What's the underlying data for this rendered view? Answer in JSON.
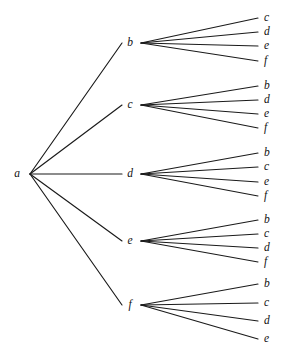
{
  "figure": {
    "type": "tree-diagram",
    "title": "",
    "background_color": "#ffffff",
    "line_color": "#1a1a1a",
    "text_color": "#111111",
    "width": 288,
    "height": 352
  },
  "tree": {
    "root": {
      "label": "a",
      "label_x": 17,
      "label_y": 174,
      "hub_x": 30,
      "hub_y": 174
    },
    "level1": [
      {
        "label": "b",
        "label_x": 130,
        "label_y": 43,
        "hub_x": 141,
        "hub_y": 43,
        "edge_end_x": 122,
        "children": [
          {
            "label": "c",
            "label_x": 264,
            "label_y": 18,
            "line_end_x": 258
          },
          {
            "label": "d",
            "label_x": 264,
            "label_y": 32,
            "line_end_x": 258
          },
          {
            "label": "e",
            "label_x": 264,
            "label_y": 46,
            "line_end_x": 258
          },
          {
            "label": "f",
            "label_x": 264,
            "label_y": 61,
            "line_end_x": 258
          }
        ]
      },
      {
        "label": "c",
        "label_x": 130,
        "label_y": 105,
        "hub_x": 141,
        "hub_y": 105,
        "edge_end_x": 122,
        "children": [
          {
            "label": "b",
            "label_x": 264,
            "label_y": 86,
            "line_end_x": 258
          },
          {
            "label": "d",
            "label_x": 264,
            "label_y": 100,
            "line_end_x": 258
          },
          {
            "label": "e",
            "label_x": 264,
            "label_y": 114,
            "line_end_x": 258
          },
          {
            "label": "f",
            "label_x": 264,
            "label_y": 128,
            "line_end_x": 258
          }
        ]
      },
      {
        "label": "d",
        "label_x": 130,
        "label_y": 174,
        "hub_x": 141,
        "hub_y": 174,
        "edge_end_x": 122,
        "children": [
          {
            "label": "b",
            "label_x": 264,
            "label_y": 153,
            "line_end_x": 258
          },
          {
            "label": "c",
            "label_x": 264,
            "label_y": 167,
            "line_end_x": 258
          },
          {
            "label": "e",
            "label_x": 264,
            "label_y": 182,
            "line_end_x": 258
          },
          {
            "label": "f",
            "label_x": 264,
            "label_y": 196,
            "line_end_x": 258
          }
        ]
      },
      {
        "label": "e",
        "label_x": 130,
        "label_y": 241,
        "hub_x": 141,
        "hub_y": 241,
        "edge_end_x": 122,
        "children": [
          {
            "label": "b",
            "label_x": 264,
            "label_y": 220,
            "line_end_x": 258
          },
          {
            "label": "c",
            "label_x": 264,
            "label_y": 234,
            "line_end_x": 258
          },
          {
            "label": "d",
            "label_x": 264,
            "label_y": 248,
            "line_end_x": 258
          },
          {
            "label": "f",
            "label_x": 264,
            "label_y": 262,
            "line_end_x": 258
          }
        ]
      },
      {
        "label": "f",
        "label_x": 130,
        "label_y": 305,
        "hub_x": 141,
        "hub_y": 305,
        "edge_end_x": 122,
        "children": [
          {
            "label": "b",
            "label_x": 264,
            "label_y": 284,
            "line_end_x": 258
          },
          {
            "label": "c",
            "label_x": 264,
            "label_y": 303,
            "line_end_x": 258
          },
          {
            "label": "d",
            "label_x": 264,
            "label_y": 321,
            "line_end_x": 258
          },
          {
            "label": "e",
            "label_x": 264,
            "label_y": 339,
            "line_end_x": 258
          }
        ]
      }
    ]
  }
}
